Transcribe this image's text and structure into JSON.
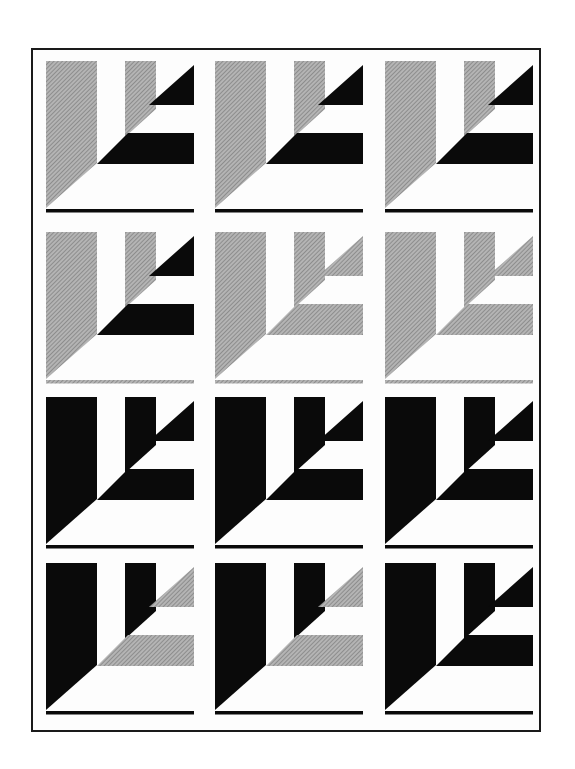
{
  "colors": {
    "black": "#0a0a0a",
    "gray": "#9a9a9a",
    "background": "#ffffff",
    "frame": "#1a1a1a"
  },
  "grid": {
    "rows": 4,
    "columns": 3,
    "column_x": [
      46,
      215,
      385
    ],
    "row_y": [
      60,
      231,
      396,
      562
    ]
  },
  "tile_parts": [
    "left-bar-wedge",
    "middle-bar",
    "upper-triangle",
    "middle-stripe",
    "baseline"
  ],
  "tiles": [
    {
      "row": 1,
      "col": 1,
      "parts": {
        "left-bar-wedge": "gray",
        "middle-bar": "gray",
        "upper-triangle": "black",
        "middle-stripe": "black",
        "baseline": "black"
      }
    },
    {
      "row": 1,
      "col": 2,
      "parts": {
        "left-bar-wedge": "gray",
        "middle-bar": "gray",
        "upper-triangle": "black",
        "middle-stripe": "black",
        "baseline": "black"
      }
    },
    {
      "row": 1,
      "col": 3,
      "parts": {
        "left-bar-wedge": "gray",
        "middle-bar": "gray",
        "upper-triangle": "black",
        "middle-stripe": "black",
        "baseline": "black"
      }
    },
    {
      "row": 2,
      "col": 1,
      "parts": {
        "left-bar-wedge": "gray",
        "middle-bar": "gray",
        "upper-triangle": "black",
        "middle-stripe": "black",
        "baseline": "gray"
      }
    },
    {
      "row": 2,
      "col": 2,
      "parts": {
        "left-bar-wedge": "gray",
        "middle-bar": "gray",
        "upper-triangle": "gray",
        "middle-stripe": "gray",
        "baseline": "gray"
      }
    },
    {
      "row": 2,
      "col": 3,
      "parts": {
        "left-bar-wedge": "gray",
        "middle-bar": "gray",
        "upper-triangle": "gray",
        "middle-stripe": "gray",
        "baseline": "gray"
      }
    },
    {
      "row": 3,
      "col": 1,
      "parts": {
        "left-bar-wedge": "black",
        "middle-bar": "black",
        "upper-triangle": "black",
        "middle-stripe": "black",
        "baseline": "black"
      }
    },
    {
      "row": 3,
      "col": 2,
      "parts": {
        "left-bar-wedge": "black",
        "middle-bar": "black",
        "upper-triangle": "black",
        "middle-stripe": "black",
        "baseline": "black"
      }
    },
    {
      "row": 3,
      "col": 3,
      "parts": {
        "left-bar-wedge": "black",
        "middle-bar": "black",
        "upper-triangle": "black",
        "middle-stripe": "black",
        "baseline": "black"
      }
    },
    {
      "row": 4,
      "col": 1,
      "parts": {
        "left-bar-wedge": "black",
        "middle-bar": "black",
        "upper-triangle": "gray",
        "middle-stripe": "gray",
        "baseline": "black"
      }
    },
    {
      "row": 4,
      "col": 2,
      "parts": {
        "left-bar-wedge": "black",
        "middle-bar": "black",
        "upper-triangle": "gray",
        "middle-stripe": "gray",
        "baseline": "black"
      }
    },
    {
      "row": 4,
      "col": 3,
      "parts": {
        "left-bar-wedge": "black",
        "middle-bar": "black",
        "upper-triangle": "black",
        "middle-stripe": "black",
        "baseline": "black"
      }
    }
  ]
}
